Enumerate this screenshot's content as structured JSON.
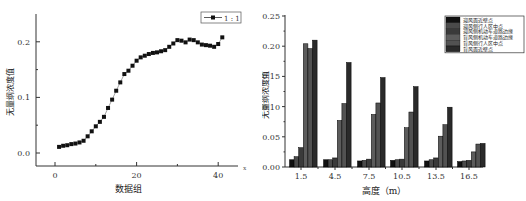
{
  "chart_data": [
    {
      "type": "scatter",
      "title": "",
      "xlabel": "数据组",
      "ylabel": "无量纲浓度值",
      "xlim": [
        -5,
        44
      ],
      "ylim": [
        -0.025,
        0.245
      ],
      "x_ticks": [
        "0",
        "20",
        "40"
      ],
      "y_ticks": [
        "0.0",
        "0.1",
        "0.2"
      ],
      "x_axis_extra_label": "x",
      "grid": false,
      "legend": {
        "position": "top-right",
        "entries": [
          "1 : 1"
        ]
      },
      "series": [
        {
          "name": "1 : 1",
          "marker": "square",
          "line": true,
          "x": [
            1,
            2,
            3,
            4,
            5,
            6,
            7,
            8,
            9,
            10,
            11,
            12,
            13,
            14,
            15,
            16,
            17,
            18,
            19,
            20,
            21,
            22,
            23,
            24,
            25,
            26,
            27,
            28,
            29,
            30,
            31,
            32,
            33,
            34,
            35,
            36,
            37,
            38,
            39,
            40,
            41
          ],
          "values": [
            0.011,
            0.013,
            0.014,
            0.016,
            0.017,
            0.019,
            0.022,
            0.03,
            0.039,
            0.048,
            0.056,
            0.065,
            0.081,
            0.096,
            0.112,
            0.127,
            0.142,
            0.148,
            0.157,
            0.166,
            0.172,
            0.175,
            0.178,
            0.18,
            0.181,
            0.183,
            0.185,
            0.191,
            0.197,
            0.203,
            0.202,
            0.199,
            0.204,
            0.203,
            0.199,
            0.195,
            0.194,
            0.193,
            0.191,
            0.196,
            0.208
          ]
        }
      ]
    },
    {
      "type": "bar",
      "title": "",
      "xlabel": "高度（m）",
      "ylabel": "无量纲浓度值",
      "ylim": [
        0,
        0.25
      ],
      "y_ticks": [
        "0.00",
        "0.05",
        "0.10",
        "0.15",
        "0.20",
        "0.25"
      ],
      "categories": [
        "1.5",
        "4.5",
        "7.5",
        "10.5",
        "13.5",
        "16.5"
      ],
      "grid": false,
      "legend": {
        "position": "top-right"
      },
      "series": [
        {
          "name": "迎风面近壁点",
          "color": "#111111",
          "values": [
            0.012,
            0.012,
            0.01,
            0.011,
            0.01,
            0.009
          ]
        },
        {
          "name": "迎风侧行人区中点",
          "color": "#4a4a4a",
          "values": [
            0.017,
            0.012,
            0.011,
            0.012,
            0.012,
            0.01
          ]
        },
        {
          "name": "迎风侧机动车道路边缘",
          "color": "#3a3a3a",
          "values": [
            0.032,
            0.015,
            0.013,
            0.013,
            0.015,
            0.011
          ]
        },
        {
          "name": "背风侧机动车道路边缘",
          "color": "#5c5c5c",
          "values": [
            0.204,
            0.077,
            0.087,
            0.065,
            0.051,
            0.025
          ]
        },
        {
          "name": "背风侧行人区中点",
          "color": "#525252",
          "values": [
            0.196,
            0.105,
            0.106,
            0.091,
            0.07,
            0.038
          ]
        },
        {
          "name": "背风面近壁点",
          "color": "#2a2a2a",
          "values": [
            0.21,
            0.173,
            0.148,
            0.133,
            0.099,
            0.039
          ]
        }
      ]
    }
  ]
}
